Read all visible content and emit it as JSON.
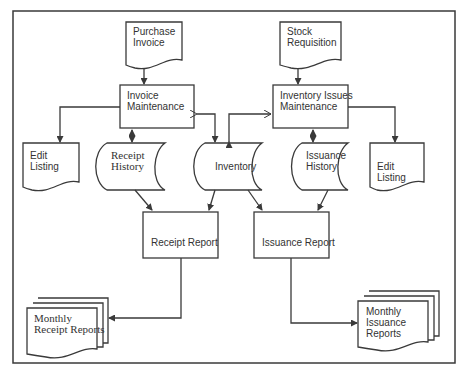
{
  "diagram": {
    "type": "system-flowchart",
    "colors": {
      "stroke": "#3a3a3a",
      "background": "#ffffff",
      "text": "#333333"
    },
    "nodes": {
      "purchase_invoice": {
        "shape": "document",
        "line1": "Purchase",
        "line2": "Invoice"
      },
      "invoice_maintenance": {
        "shape": "process",
        "line1": "Invoice",
        "line2": "Maintenance"
      },
      "stock_requisition": {
        "shape": "document",
        "line1": "Stock",
        "line2": "Requisition"
      },
      "inventory_issues_maintenance": {
        "shape": "process",
        "line1": "Inventory Issues",
        "line2": "Maintenance"
      },
      "edit_listing_left": {
        "shape": "document",
        "line1": "Edit",
        "line2": "Listing"
      },
      "receipt_history": {
        "shape": "stored-data",
        "line1": "Receipt",
        "line2": "History"
      },
      "inventory": {
        "shape": "stored-data",
        "label": "Inventory"
      },
      "issuance_history": {
        "shape": "stored-data",
        "line1": "Issuance",
        "line2": "History"
      },
      "edit_listing_right": {
        "shape": "document",
        "line1": "Edit",
        "line2": "Listing"
      },
      "receipt_report": {
        "shape": "process",
        "label": "Receipt Report"
      },
      "issuance_report": {
        "shape": "process",
        "label": "Issuance Report"
      },
      "monthly_receipt_reports": {
        "shape": "multi-document",
        "line1": "Monthly",
        "line2": "Receipt Reports"
      },
      "monthly_issuance_reports": {
        "shape": "multi-document",
        "line1": "Monthly",
        "line2": "Issuance",
        "line3": "Reports"
      }
    },
    "edges": [
      {
        "from": "Purchase Invoice",
        "to": "Invoice Maintenance"
      },
      {
        "from": "Stock Requisition",
        "to": "Inventory Issues Maintenance"
      },
      {
        "from": "Invoice Maintenance",
        "to": "Edit Listing (left)"
      },
      {
        "from": "Invoice Maintenance",
        "to": "Receipt History",
        "bidirectional": true
      },
      {
        "from": "Invoice Maintenance",
        "to": "Inventory",
        "bidirectional": true
      },
      {
        "from": "Inventory Issues Maintenance",
        "to": "Inventory",
        "bidirectional": true
      },
      {
        "from": "Inventory Issues Maintenance",
        "to": "Issuance History",
        "bidirectional": true
      },
      {
        "from": "Inventory Issues Maintenance",
        "to": "Edit Listing (right)"
      },
      {
        "from": "Receipt History",
        "to": "Receipt Report"
      },
      {
        "from": "Inventory",
        "to": "Receipt Report"
      },
      {
        "from": "Inventory",
        "to": "Issuance Report"
      },
      {
        "from": "Issuance History",
        "to": "Issuance Report"
      },
      {
        "from": "Receipt Report",
        "to": "Monthly Receipt Reports"
      },
      {
        "from": "Issuance Report",
        "to": "Monthly Issuance Reports"
      }
    ]
  }
}
